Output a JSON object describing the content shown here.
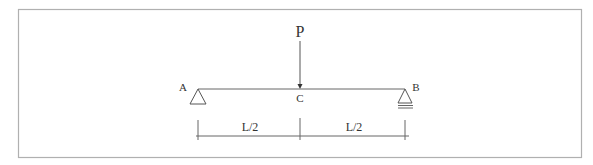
{
  "diagram": {
    "type": "simply-supported-beam",
    "colors": {
      "frame": "#b0b0b0",
      "line": "#555555",
      "text": "#333333",
      "background": "#ffffff"
    },
    "load": {
      "label": "P",
      "point": "C"
    },
    "supports": {
      "left": {
        "label": "A",
        "type": "pin"
      },
      "right": {
        "label": "B",
        "type": "roller"
      }
    },
    "midpoint": {
      "label": "C"
    },
    "dimensions": [
      {
        "label": "L/2"
      },
      {
        "label": "L/2"
      }
    ]
  }
}
